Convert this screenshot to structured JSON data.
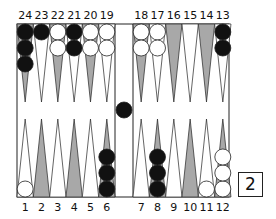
{
  "board": {
    "top_labels": [
      "24",
      "23",
      "22",
      "21",
      "20",
      "19",
      "18",
      "17",
      "16",
      "15",
      "14",
      "13"
    ],
    "bottom_labels": [
      "1",
      "2",
      "3",
      "4",
      "5",
      "6",
      "7",
      "8",
      "9",
      "10",
      "11",
      "12"
    ],
    "colors": {
      "shaded_point": "#a8a8a8",
      "light_point": "#ffffff",
      "black_checker": "#111111",
      "white_checker": "#ffffff",
      "line": "#222222"
    },
    "points": {
      "24": {
        "color": "black",
        "count": 3
      },
      "23": {
        "color": "black",
        "count": 1
      },
      "22": {
        "color": "white",
        "count": 2
      },
      "21": {
        "color": "black",
        "count": 2
      },
      "20": {
        "color": "white",
        "count": 2
      },
      "19": {
        "color": "white",
        "count": 2
      },
      "18": {
        "color": "white",
        "count": 2
      },
      "17": {
        "color": "white",
        "count": 2
      },
      "13": {
        "color": "black",
        "count": 2
      },
      "1": {
        "color": "white",
        "count": 1
      },
      "6": {
        "color": "black",
        "count": 3
      },
      "8": {
        "color": "black",
        "count": 3
      },
      "11": {
        "color": "white",
        "count": 1
      },
      "12": {
        "color": "white",
        "count": 3
      }
    },
    "bar": {
      "color": "black",
      "count": 1
    }
  },
  "cube": {
    "value": "2"
  }
}
